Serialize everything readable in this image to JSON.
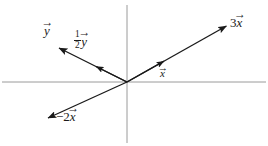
{
  "figure": {
    "name": "vector-scalar-multiples-diagram",
    "background_color": "#ffffff",
    "width": 268,
    "height": 146,
    "axis_color": "#9a9a9a",
    "vector_color": "#1a1a1a",
    "text_color": "#1a1a1a",
    "origin": {
      "x": 127,
      "y": 82
    }
  },
  "axes": {
    "horizontal": {
      "label": "horizontal-axis",
      "x1": 2,
      "y1": 82,
      "x2": 266,
      "y2": 82
    },
    "vertical": {
      "label": "vertical-axis",
      "x1": 127,
      "y1": 5,
      "x2": 127,
      "y2": 143
    }
  },
  "vectors": [
    {
      "id": "three-x",
      "label_text": "3x",
      "coefficient": "3",
      "name": "x",
      "has_over_arrow": true,
      "x1": 127,
      "y1": 82,
      "x2": 228,
      "y2": 25,
      "label_x": 230,
      "label_y": 16
    },
    {
      "id": "x",
      "label_text": "x",
      "coefficient": "",
      "name": "x",
      "has_over_arrow": true,
      "x1": 127,
      "y1": 82,
      "x2": 166,
      "y2": 60,
      "label_x": 160,
      "label_y": 68
    },
    {
      "id": "negative-two-x",
      "label_text": "-2x",
      "coefficient": "2",
      "name": "x",
      "has_over_arrow": true,
      "x1": 127,
      "y1": 82,
      "x2": 46,
      "y2": 119,
      "label_x": 56,
      "label_y": 110
    },
    {
      "id": "y",
      "label_text": "y",
      "coefficient": "",
      "name": "y",
      "has_over_arrow": true,
      "x1": 127,
      "y1": 82,
      "x2": 57,
      "y2": 47,
      "label_x": 44,
      "label_y": 24
    },
    {
      "id": "half-y",
      "label_text": "1/2 y",
      "coefficient": "1/2",
      "name": "y",
      "has_over_arrow": true,
      "x1": 127,
      "y1": 82,
      "x2": 95,
      "y2": 66,
      "label_x": 74,
      "label_y": 30
    }
  ],
  "labels": {
    "y": {
      "name": "y",
      "arrow": "→"
    },
    "half_y": {
      "numerator": "1",
      "denominator": "2",
      "name": "y",
      "arrow": "→"
    },
    "three_x": {
      "coefficient": "3",
      "name": "x",
      "arrow": "→"
    },
    "x": {
      "name": "x",
      "arrow": "→"
    },
    "neg_two_x": {
      "minus": "−",
      "coefficient": "2",
      "name": "x",
      "arrow": "→"
    }
  }
}
